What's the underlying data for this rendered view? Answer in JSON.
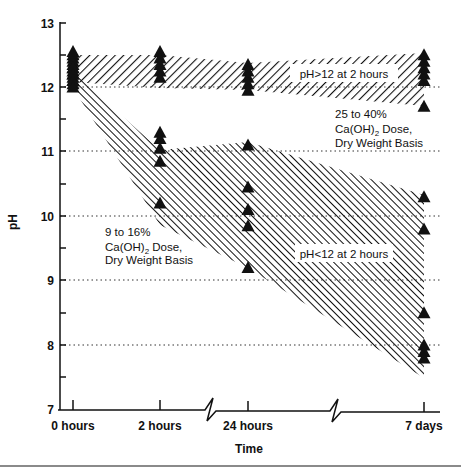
{
  "chart_data": {
    "type": "scatter",
    "title": "",
    "xlabel": "Time",
    "ylabel": "pH",
    "ylim": [
      7,
      13
    ],
    "yticks": [
      7,
      8,
      9,
      10,
      11,
      12,
      13
    ],
    "categories": [
      "0 hours",
      "2 hours",
      "24 hours",
      "7 days"
    ],
    "grid": "dotted horizontal lines at pH 8, 9, 10, 11, 12",
    "axis_breaks": [
      "between 2 hours and 24 hours",
      "between 24 hours and 7 days"
    ],
    "series": [
      {
        "name": "pH>12 at 2 hours (25 to 40% Ca(OH)2 Dose, Dry Weight Basis)",
        "marker": "filled triangle",
        "points": {
          "0 hours": [
            12.55,
            12.5,
            12.45,
            12.4,
            12.35,
            12.3,
            12.25,
            12.2,
            12.15,
            12.1,
            12.05
          ],
          "2 hours": [
            12.55,
            12.45,
            12.35,
            12.25,
            12.15
          ],
          "24 hours": [
            12.35,
            12.25,
            12.15,
            12.05,
            11.95
          ],
          "7 days": [
            12.5,
            12.4,
            12.3,
            12.2,
            12.1,
            11.7
          ]
        },
        "band": {
          "upper": [
            12.5,
            12.5,
            12.38,
            12.52
          ],
          "lower": [
            12.1,
            12.0,
            11.95,
            11.72
          ]
        }
      },
      {
        "name": "pH<12 at 2 hours (9 to 16% Ca(OH)2 Dose, Dry Weight Basis)",
        "marker": "filled triangle",
        "points": {
          "0 hours": [
            12.3,
            12.2,
            12.1,
            12.0
          ],
          "2 hours": [
            11.3,
            11.2,
            11.05,
            10.85,
            10.2
          ],
          "24 hours": [
            11.1,
            10.45,
            10.1,
            9.85,
            9.2
          ],
          "7 days": [
            10.3,
            9.8,
            8.5,
            8.0,
            7.9,
            7.8
          ]
        },
        "band": {
          "upper": [
            12.3,
            11.15,
            11.05,
            10.3
          ],
          "lower": [
            12.0,
            10.2,
            9.2,
            7.8
          ]
        }
      }
    ],
    "annotations": [
      {
        "text": "pH>12 at 2 hours",
        "position": "inside upper band"
      },
      {
        "text": "25 to 40% Ca(OH)2 Dose, Dry Weight Basis",
        "position": "below upper band, right"
      },
      {
        "text": "9 to 16% Ca(OH)2 Dose, Dry Weight Basis",
        "position": "below lower band, left"
      },
      {
        "text": "pH<12 at 2 hours",
        "position": "inside lower band"
      }
    ]
  },
  "axes": {
    "y_title": "pH",
    "x_title": "Time",
    "y_ticks": [
      "13",
      "12",
      "11",
      "10",
      "9",
      "8",
      "7"
    ],
    "x_ticks": [
      "0 hours",
      "2 hours",
      "24 hours",
      "7 days"
    ]
  },
  "labels": {
    "upper_band": "pH>12 at 2 hours",
    "upper_dose_line1": "25 to 40%",
    "upper_dose_line2_pre": "Ca(OH)",
    "upper_dose_line2_sub": "2",
    "upper_dose_line2_post": " Dose,",
    "upper_dose_line3": "Dry Weight Basis",
    "lower_band": "pH<12 at 2 hours",
    "lower_dose_line1": "9 to 16%",
    "lower_dose_line2_pre": "Ca(OH)",
    "lower_dose_line2_sub": "2",
    "lower_dose_line2_post": " Dose,",
    "lower_dose_line3": "Dry Weight Basis"
  },
  "colors": {
    "ink": "#111111",
    "background": "#ffffff",
    "rule": "#8a8a8a"
  }
}
